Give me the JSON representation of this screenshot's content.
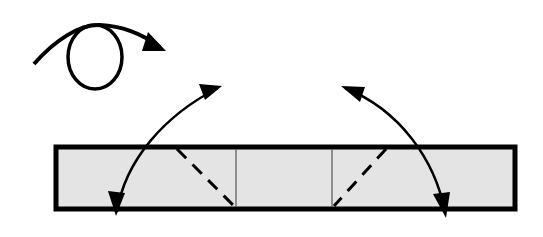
{
  "diagram": {
    "type": "origami-fold-instruction",
    "colors": {
      "background": "#ffffff",
      "paper_fill": "#e4e4e4",
      "stroke": "#000000",
      "crease": "#555555"
    },
    "symbols": [
      {
        "name": "turn-over-symbol",
        "description": "loop arrow indicating turn the model over"
      },
      {
        "name": "fold-arrow-left",
        "description": "curved double-headed arrow fold-and-unfold, left side"
      },
      {
        "name": "fold-arrow-right",
        "description": "curved double-headed arrow fold-and-unfold, right side"
      }
    ],
    "paper_strip": {
      "x": 56,
      "y": 147,
      "width": 459,
      "height": 62,
      "creases": [
        {
          "type": "mountain-line",
          "x": 236
        },
        {
          "type": "mountain-line",
          "x": 332
        }
      ],
      "valley_folds": [
        {
          "from": [
            177,
            148
          ],
          "to": [
            236,
            208
          ]
        },
        {
          "from": [
            391,
            148
          ],
          "to": [
            332,
            208
          ]
        }
      ]
    }
  }
}
